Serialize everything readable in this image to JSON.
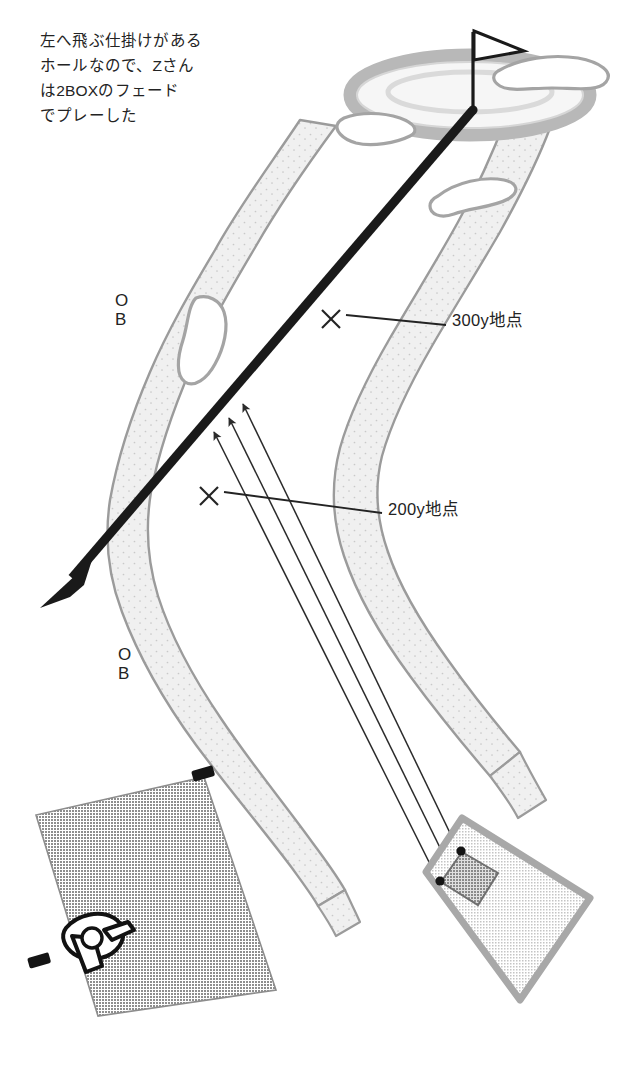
{
  "diagram": {
    "kind": "golf-hole-layout",
    "title_caption": "左へ飛ぶ仕掛けがある\nホールなので、Zさん\nは2BOXのフェード\nでプレーした",
    "colors": {
      "ink": "#232323",
      "shot_line": "#1a1a1a",
      "rough_fill": "#efefef",
      "rough_outline": "#9b9b9b",
      "green_ring": "#b4b4b4",
      "green_fill": "#f2f2f2",
      "bunker_outline": "#9b9b9b",
      "teebox_dark": "#9a9a9a",
      "teebox_light": "#dcdcdc",
      "teebox_border": "#a8a8a8",
      "tee_marker": "#151515",
      "background": "#ffffff"
    },
    "markers": {
      "ob_upper": {
        "line1": "O",
        "line2": "B"
      },
      "ob_lower": {
        "line1": "O",
        "line2": "B"
      },
      "yardage_300": "300y地点",
      "yardage_200": "200y地点"
    },
    "features": {
      "green_label": "green",
      "flag_label": "pin-flag",
      "shot_line_label": "fade-shot-trajectory",
      "aim_arrows_count": 3,
      "tee_box_back_label": "back-tee-box",
      "tee_box_front_label": "front-tee-box-2box",
      "golfer_icon_label": "golfer-figure"
    }
  }
}
